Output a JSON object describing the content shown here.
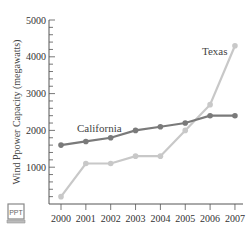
{
  "chart_data": {
    "type": "line",
    "title": "",
    "xlabel": "",
    "ylabel": "Wind Ppower Capacity (megawatts)",
    "x": [
      2000,
      2001,
      2002,
      2003,
      2004,
      2005,
      2006,
      2007
    ],
    "x_tick_labels": [
      "2000",
      "2001",
      "2002",
      "2003",
      "2004",
      "2005",
      "2006",
      "2007"
    ],
    "y_tick_labels": [
      "1000",
      "2000",
      "3000",
      "4000",
      "5000"
    ],
    "ylim": [
      0,
      5000
    ],
    "grid": false,
    "legend_position": "inline labels",
    "series": [
      {
        "name": "California",
        "color": "#7a7a7a",
        "values": [
          1600,
          1700,
          1800,
          2000,
          2100,
          2200,
          2400,
          2400
        ]
      },
      {
        "name": "Texas",
        "color": "#c8c8c8",
        "values": [
          200,
          1100,
          1100,
          1300,
          1300,
          2000,
          2700,
          4300
        ]
      }
    ]
  },
  "labels": {
    "california": "California",
    "texas": "Texas",
    "ppt_badge": "PPT"
  }
}
